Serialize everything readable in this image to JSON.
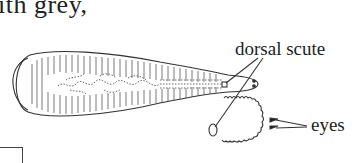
{
  "text_fragment": "ith grey,",
  "labels": {
    "dorsal_scute": "dorsal scute",
    "eyes": "eyes"
  },
  "figure": {
    "parts": [
      "body",
      "dorsal scute",
      "head enlargement",
      "eyes"
    ]
  }
}
